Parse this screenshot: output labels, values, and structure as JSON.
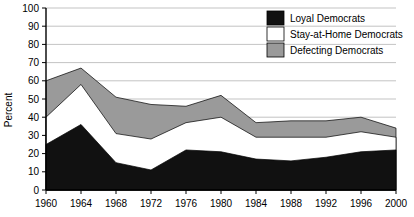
{
  "chart_data": {
    "type": "area",
    "stacked": true,
    "title": "",
    "xlabel": "",
    "ylabel": "Percent",
    "categories": [
      "1960",
      "1964",
      "1968",
      "1972",
      "1976",
      "1980",
      "1984",
      "1988",
      "1992",
      "1996",
      "2000"
    ],
    "x": [
      1960,
      1964,
      1968,
      1972,
      1976,
      1980,
      1984,
      1988,
      1992,
      1996,
      2000
    ],
    "xlim": [
      1960,
      2000
    ],
    "ylim": [
      0,
      100
    ],
    "ytick_labels": [
      "0",
      "10",
      "20",
      "30",
      "40",
      "50",
      "60",
      "70",
      "80",
      "90",
      "100"
    ],
    "yticks": [
      0,
      10,
      20,
      30,
      40,
      50,
      60,
      70,
      80,
      90,
      100
    ],
    "grid": true,
    "legend_position": "top-right",
    "series": [
      {
        "name": "Loyal Democrats",
        "color": "#111111",
        "values": [
          25,
          36,
          15,
          11,
          22,
          21,
          17,
          16,
          18,
          21,
          22
        ]
      },
      {
        "name": "Stay-at-Home Democrats",
        "color": "#ffffff",
        "values": [
          15,
          22,
          16,
          17,
          15,
          19,
          12,
          13,
          11,
          11,
          7
        ]
      },
      {
        "name": "Defecting Democrats",
        "color": "#9a9a9a",
        "values": [
          20,
          9,
          20,
          19,
          9,
          12,
          8,
          9,
          9,
          8,
          5
        ]
      }
    ],
    "cumulative_tops": {
      "loyal": [
        25,
        36,
        15,
        11,
        22,
        21,
        17,
        16,
        18,
        21,
        22
      ],
      "loyal_plus_stayhome": [
        40,
        58,
        31,
        28,
        37,
        40,
        29,
        29,
        29,
        32,
        29
      ],
      "total": [
        60,
        67,
        51,
        47,
        46,
        52,
        37,
        38,
        38,
        40,
        34
      ]
    }
  },
  "legend": {
    "items": [
      {
        "label": "Loyal Democrats",
        "color": "#111111"
      },
      {
        "label": "Stay-at-Home Democrats",
        "color": "#ffffff"
      },
      {
        "label": "Defecting Democrats",
        "color": "#9a9a9a"
      }
    ]
  }
}
